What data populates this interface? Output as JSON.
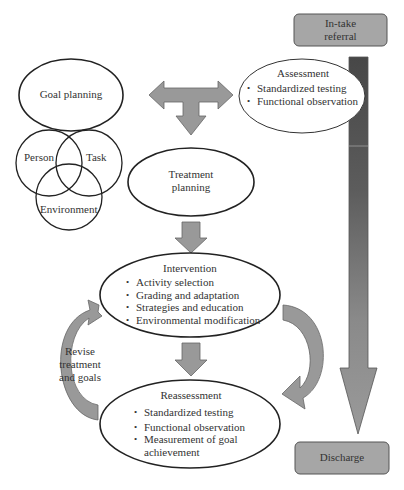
{
  "diagram": {
    "colors": {
      "arrow_fill": "#999999",
      "arrow_stroke": "#666666",
      "box_fill": "#a6a6a6",
      "timeline_dark": "#4a4a4a",
      "timeline_light": "#9a9a9a",
      "outline": "#222222"
    },
    "intake": {
      "label_line1": "In-take",
      "label_line2": "referral"
    },
    "discharge": {
      "label": "Discharge"
    },
    "goal_planning": {
      "label": "Goal planning"
    },
    "assessment": {
      "title": "Assessment",
      "items": [
        "Standardized testing",
        "Functional observation"
      ]
    },
    "venn": {
      "person": "Person",
      "task": "Task",
      "environment": "Environment"
    },
    "treatment_planning": {
      "label_line1": "Treatment",
      "label_line2": "planning"
    },
    "intervention": {
      "title": "Intervention",
      "items": [
        "Activity selection",
        "Grading and adaptation",
        "Strategies and education",
        "Environmental modification"
      ]
    },
    "revise": {
      "line1": "Revise",
      "line2": "treatment",
      "line3": "and goals"
    },
    "reassessment": {
      "title": "Reassessment",
      "items": [
        "Standardized testing",
        "Functional observation",
        "Measurement of goal",
        "achievement"
      ]
    }
  }
}
